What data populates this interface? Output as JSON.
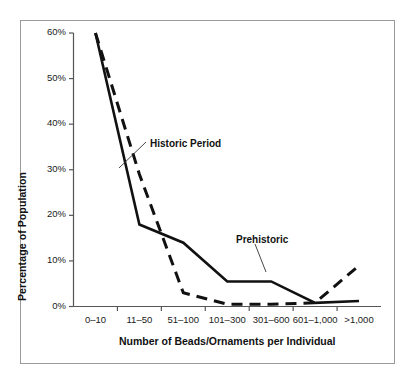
{
  "chart_data": {
    "type": "line",
    "title": "",
    "xlabel": "Number of Beads/Ornaments per Individual",
    "ylabel": "Percentage of Population",
    "categories": [
      "0–10",
      "11–50",
      "51–100",
      "101–300",
      "301–600",
      "601–1,000",
      ">1,000"
    ],
    "ytick_labels": [
      "0%",
      "10%",
      "20%",
      "30%",
      "40%",
      "50%",
      "60%"
    ],
    "ytick_values": [
      0,
      10,
      20,
      30,
      40,
      50,
      60
    ],
    "ylim": [
      0,
      60
    ],
    "grid": false,
    "legend_position": "inline-annotations",
    "series": [
      {
        "name": "Prehistoric",
        "style": "solid",
        "color": "#111111",
        "values": [
          60,
          18,
          14,
          5.5,
          5.5,
          0.8,
          1.2
        ]
      },
      {
        "name": "Historic Period",
        "style": "dashed",
        "color": "#111111",
        "values": [
          60,
          29,
          3,
          0.5,
          0.5,
          0.8,
          9
        ]
      }
    ],
    "annotations": [
      {
        "text": "Historic Period",
        "target_series": "Historic Period",
        "label_x": 150,
        "label_y": 138
      },
      {
        "text": "Prehistoric",
        "target_series": "Prehistoric",
        "label_x": 236,
        "label_y": 234
      }
    ]
  }
}
